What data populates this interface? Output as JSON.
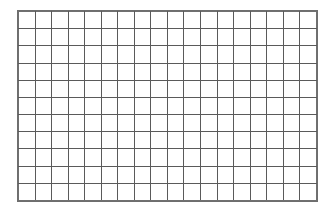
{
  "document": {
    "type": "blank-grid",
    "title": "",
    "description": "Empty rectangular grid of cells"
  },
  "canvas": {
    "width_px": 333,
    "height_px": 215,
    "background_color": "#ffffff"
  },
  "grid": {
    "columns": 18,
    "rows": 11,
    "left_px": 18,
    "top_px": 11,
    "width_px": 299,
    "height_px": 190,
    "cell_width_px": 16.6,
    "cell_height_px": 17.3,
    "line_color": "#5a5a5a",
    "border_color": "#6e6e6e",
    "line_width_px": 1,
    "cell_fill": "#ffffff",
    "cells": [
      [
        "",
        "",
        "",
        "",
        "",
        "",
        "",
        "",
        "",
        "",
        "",
        "",
        "",
        "",
        "",
        "",
        "",
        ""
      ],
      [
        "",
        "",
        "",
        "",
        "",
        "",
        "",
        "",
        "",
        "",
        "",
        "",
        "",
        "",
        "",
        "",
        "",
        ""
      ],
      [
        "",
        "",
        "",
        "",
        "",
        "",
        "",
        "",
        "",
        "",
        "",
        "",
        "",
        "",
        "",
        "",
        "",
        ""
      ],
      [
        "",
        "",
        "",
        "",
        "",
        "",
        "",
        "",
        "",
        "",
        "",
        "",
        "",
        "",
        "",
        "",
        "",
        ""
      ],
      [
        "",
        "",
        "",
        "",
        "",
        "",
        "",
        "",
        "",
        "",
        "",
        "",
        "",
        "",
        "",
        "",
        "",
        ""
      ],
      [
        "",
        "",
        "",
        "",
        "",
        "",
        "",
        "",
        "",
        "",
        "",
        "",
        "",
        "",
        "",
        "",
        "",
        ""
      ],
      [
        "",
        "",
        "",
        "",
        "",
        "",
        "",
        "",
        "",
        "",
        "",
        "",
        "",
        "",
        "",
        "",
        "",
        ""
      ],
      [
        "",
        "",
        "",
        "",
        "",
        "",
        "",
        "",
        "",
        "",
        "",
        "",
        "",
        "",
        "",
        "",
        "",
        ""
      ],
      [
        "",
        "",
        "",
        "",
        "",
        "",
        "",
        "",
        "",
        "",
        "",
        "",
        "",
        "",
        "",
        "",
        "",
        ""
      ],
      [
        "",
        "",
        "",
        "",
        "",
        "",
        "",
        "",
        "",
        "",
        "",
        "",
        "",
        "",
        "",
        "",
        "",
        ""
      ],
      [
        "",
        "",
        "",
        "",
        "",
        "",
        "",
        "",
        "",
        "",
        "",
        "",
        "",
        "",
        "",
        "",
        "",
        ""
      ]
    ]
  }
}
